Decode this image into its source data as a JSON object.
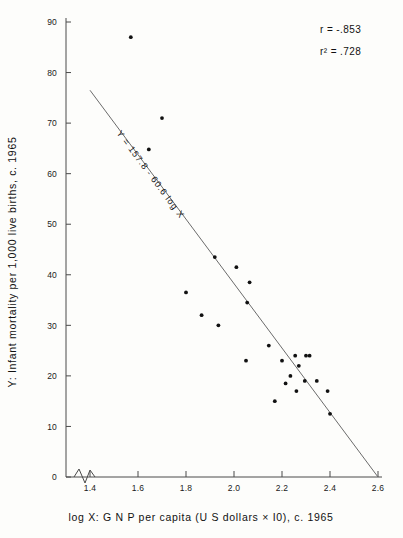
{
  "chart_data": {
    "type": "scatter",
    "title": "",
    "xlabel": "log X: G N P per capita (U S dollars × I0), c. 1965",
    "ylabel": "Y: Infant mortality per 1,000 live births, c. 1965",
    "xlim": [
      1.3,
      2.6
    ],
    "ylim": [
      0,
      90
    ],
    "xticks": [
      "1.4",
      "1.6",
      "1.8",
      "2.0",
      "2.2",
      "2.4",
      "2.6"
    ],
    "xtick_values": [
      1.4,
      1.6,
      1.8,
      2.0,
      2.2,
      2.4,
      2.6
    ],
    "yticks": [
      "0",
      "10",
      "20",
      "30",
      "40",
      "50",
      "60",
      "70",
      "80",
      "90"
    ],
    "ytick_values": [
      0,
      10,
      20,
      30,
      40,
      50,
      60,
      70,
      80,
      90
    ],
    "grid": false,
    "axis_break": true,
    "axis_break_note": "zigzag break on x-axis between origin and 1.4",
    "legend": "none",
    "points": [
      {
        "x": 1.57,
        "y": 87.0
      },
      {
        "x": 1.7,
        "y": 71.0
      },
      {
        "x": 1.645,
        "y": 64.8
      },
      {
        "x": 1.92,
        "y": 43.5
      },
      {
        "x": 2.01,
        "y": 41.5
      },
      {
        "x": 2.065,
        "y": 38.5
      },
      {
        "x": 1.8,
        "y": 36.5
      },
      {
        "x": 2.055,
        "y": 34.5
      },
      {
        "x": 1.865,
        "y": 32.0
      },
      {
        "x": 1.935,
        "y": 30.0
      },
      {
        "x": 2.145,
        "y": 26.0
      },
      {
        "x": 2.05,
        "y": 23.0
      },
      {
        "x": 2.2,
        "y": 23.0
      },
      {
        "x": 2.255,
        "y": 24.0
      },
      {
        "x": 2.3,
        "y": 24.0
      },
      {
        "x": 2.315,
        "y": 24.0
      },
      {
        "x": 2.27,
        "y": 22.0
      },
      {
        "x": 2.235,
        "y": 20.0
      },
      {
        "x": 2.295,
        "y": 19.0
      },
      {
        "x": 2.345,
        "y": 19.0
      },
      {
        "x": 2.215,
        "y": 18.5
      },
      {
        "x": 2.26,
        "y": 17.0
      },
      {
        "x": 2.39,
        "y": 17.0
      },
      {
        "x": 2.17,
        "y": 15.0
      },
      {
        "x": 2.4,
        "y": 12.5
      }
    ],
    "regression": {
      "equation_label": "Y = 157.8 - 60.6 log X",
      "intercept": 157.8,
      "slope": -60.6,
      "x_start": 1.4,
      "y_start": 76.5,
      "x_end": 2.6,
      "y_end": 0.0
    },
    "annotations": {
      "r_label": "r = -.853",
      "r_squared_label": "r² = .728",
      "r_value": -0.853,
      "r_squared_value": 0.728
    },
    "colors": {
      "point": "#111111",
      "line": "#6b6b6b",
      "axis": "#4a4a4a",
      "background": "#fdfdfb",
      "text": "#111111"
    }
  }
}
